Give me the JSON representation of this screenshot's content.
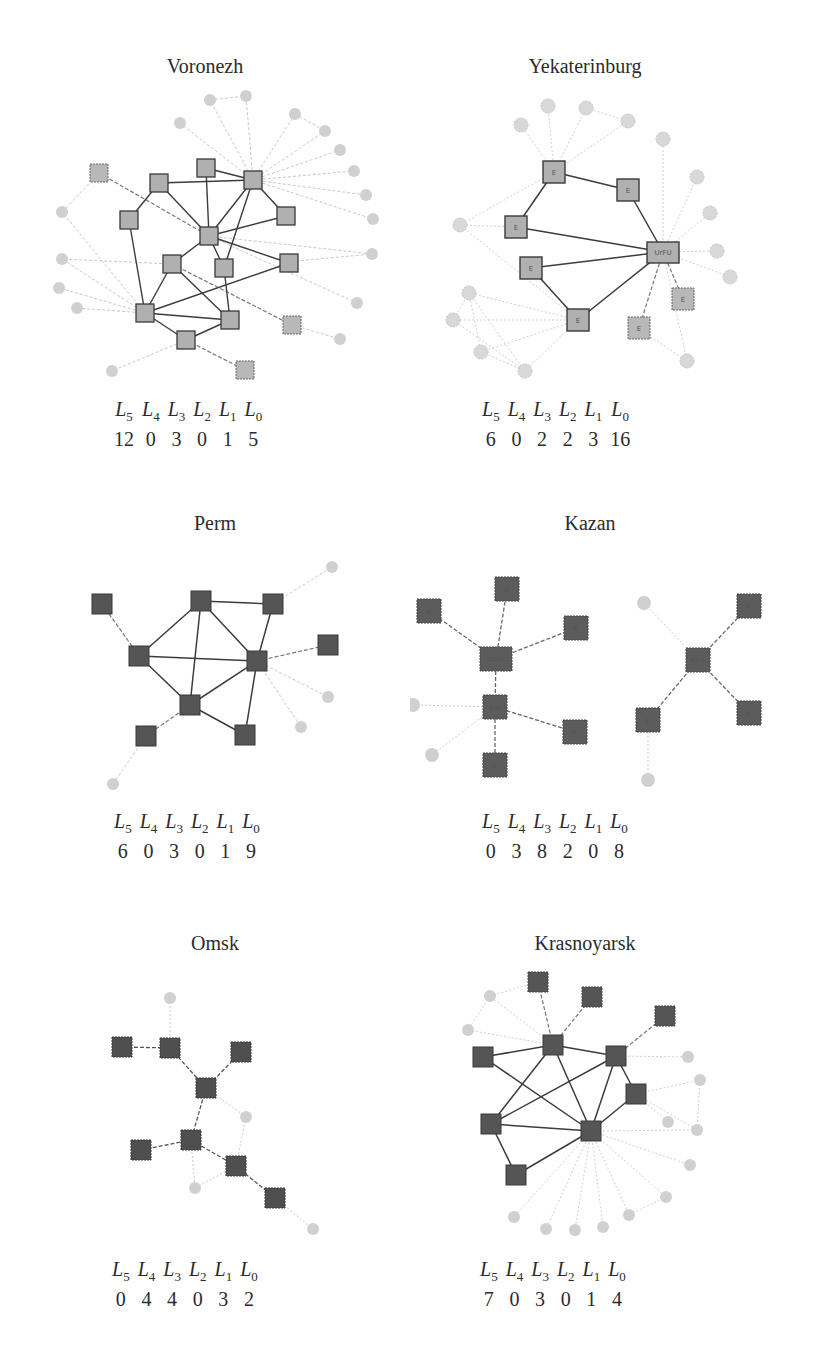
{
  "figure": {
    "level_labels": [
      {
        "base": "L",
        "sub": "5"
      },
      {
        "base": "L",
        "sub": "4"
      },
      {
        "base": "L",
        "sub": "3"
      },
      {
        "base": "L",
        "sub": "2"
      },
      {
        "base": "L",
        "sub": "1"
      },
      {
        "base": "L",
        "sub": "0"
      }
    ],
    "colors": {
      "light_square_fill": "#b0b0b0",
      "dark_square_fill": "#555555",
      "square_border": "#3a3a3a",
      "peripheral_circle": "#d0d0d0",
      "strong_edge": "#3c3c3c",
      "weak_edge": "#c8c8c8",
      "background": "#ffffff"
    },
    "panels": [
      {
        "title": "Voronezh",
        "counts": [
          "12",
          "0",
          "3",
          "0",
          "1",
          "5"
        ],
        "node_label": "V"
      },
      {
        "title": "Yekaterinburg",
        "counts": [
          "6",
          "0",
          "2",
          "2",
          "3",
          "16"
        ],
        "node_label": "E",
        "hub_label": "UrFU"
      },
      {
        "title": "Perm",
        "counts": [
          "6",
          "0",
          "3",
          "0",
          "1",
          "9"
        ]
      },
      {
        "title": "Kazan",
        "counts": [
          "0",
          "3",
          "8",
          "2",
          "0",
          "8"
        ],
        "node_label": "K",
        "hub_labels": [
          "KTMY",
          "KAI",
          "KFU"
        ]
      },
      {
        "title": "Omsk",
        "counts": [
          "0",
          "4",
          "4",
          "0",
          "3",
          "2"
        ]
      },
      {
        "title": "Krasnoyarsk",
        "counts": [
          "7",
          "0",
          "3",
          "0",
          "1",
          "4"
        ]
      }
    ]
  }
}
